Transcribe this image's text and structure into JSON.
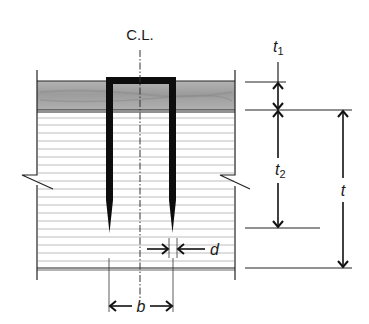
{
  "diagram": {
    "centerline_label": "C.L.",
    "dimensions": {
      "t1": {
        "symbol": "t",
        "subscript": "1"
      },
      "t2": {
        "symbol": "t",
        "subscript": "2"
      },
      "t": {
        "symbol": "t"
      },
      "d": {
        "symbol": "d"
      },
      "b": {
        "symbol": "b"
      }
    },
    "colors": {
      "top_layer": "#a9a9a9",
      "hatch_lines": "#bdbdbd",
      "lines": "#1a1a1a",
      "staple": "#0d0d0d",
      "background": "#ffffff"
    }
  }
}
